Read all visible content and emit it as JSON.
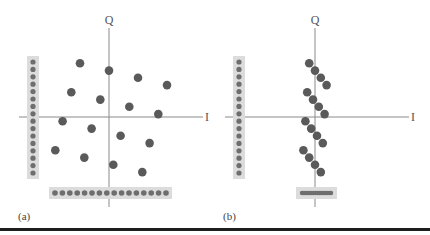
{
  "figure": {
    "colors": {
      "point": "#5a5a5a",
      "axis": "#8a8a8a",
      "projection_band": "#dcdcdc",
      "projection_dot": "#6e6e6e",
      "rule": "#1e1e1e"
    },
    "panels": [
      {
        "id": "a",
        "label": "(a)",
        "q_axis_label": "Q",
        "i_axis_label": "I",
        "points": [
          [
            -1.0,
            1.85
          ],
          [
            0.0,
            1.6
          ],
          [
            1.0,
            1.35
          ],
          [
            2.0,
            1.1
          ],
          [
            -1.3,
            0.85
          ],
          [
            -0.3,
            0.6
          ],
          [
            0.7,
            0.35
          ],
          [
            1.7,
            0.1
          ],
          [
            -1.6,
            -0.15
          ],
          [
            -0.6,
            -0.4
          ],
          [
            0.4,
            -0.65
          ],
          [
            1.4,
            -0.9
          ],
          [
            -1.85,
            -1.15
          ],
          [
            -0.85,
            -1.4
          ],
          [
            0.15,
            -1.65
          ],
          [
            1.15,
            -1.9
          ]
        ],
        "q_projection_count": 16,
        "i_projection_count": 16,
        "i_projection_spread": "wide"
      },
      {
        "id": "b",
        "label": "(b)",
        "q_axis_label": "Q",
        "i_axis_label": "I",
        "points": [
          [
            -0.2,
            1.85
          ],
          [
            0.0,
            1.6
          ],
          [
            0.2,
            1.35
          ],
          [
            0.4,
            1.1
          ],
          [
            -0.27,
            0.85
          ],
          [
            -0.07,
            0.6
          ],
          [
            0.13,
            0.35
          ],
          [
            0.33,
            0.1
          ],
          [
            -0.33,
            -0.15
          ],
          [
            -0.13,
            -0.4
          ],
          [
            0.07,
            -0.65
          ],
          [
            0.27,
            -0.9
          ],
          [
            -0.4,
            -1.15
          ],
          [
            -0.2,
            -1.4
          ],
          [
            0.0,
            -1.65
          ],
          [
            0.2,
            -1.9
          ]
        ],
        "q_projection_count": 16,
        "i_projection_count": 16,
        "i_projection_spread": "narrow"
      }
    ]
  }
}
